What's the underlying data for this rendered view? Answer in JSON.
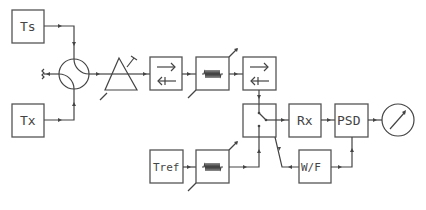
{
  "diagram": {
    "type": "block-diagram",
    "blocks": {
      "ts": {
        "label": "Ts"
      },
      "tx": {
        "label": "Tx"
      },
      "rx": {
        "label": "Rx"
      },
      "psd": {
        "label": "PSD"
      },
      "wf": {
        "label": "W/F"
      },
      "tref": {
        "label": "Tref"
      }
    },
    "components": [
      {
        "id": "circulator",
        "icon": "circulator-icon"
      },
      {
        "id": "amplifier",
        "icon": "triangle-amplifier-icon"
      },
      {
        "id": "isolator-1",
        "icon": "isolator-icon"
      },
      {
        "id": "attenuator-1",
        "icon": "variable-attenuator-icon"
      },
      {
        "id": "isolator-2",
        "icon": "isolator-icon"
      },
      {
        "id": "switch",
        "icon": "switch-icon"
      },
      {
        "id": "attenuator-2",
        "icon": "variable-attenuator-icon"
      },
      {
        "id": "meter",
        "icon": "meter-icon"
      },
      {
        "id": "termination",
        "icon": "termination-icon"
      }
    ]
  }
}
